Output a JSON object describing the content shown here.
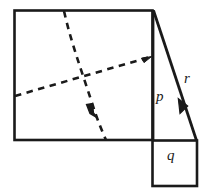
{
  "figure": {
    "background_color": "#ffffff",
    "stroke_color": "#1a1a1a",
    "labels": {
      "p": "p",
      "q": "q",
      "r": "r"
    },
    "shapes": {
      "main_square": {
        "name": "large-square",
        "x": 14,
        "y": 10,
        "width": 139,
        "height": 130,
        "style": "solid"
      },
      "small_square": {
        "name": "small-square",
        "x": 152,
        "y": 140,
        "width": 45,
        "height": 46,
        "style": "solid"
      },
      "vertical_segment_p": {
        "name": "segment-p",
        "x1": 153,
        "y1": 10,
        "x2": 153,
        "y2": 140,
        "style": "solid"
      },
      "slant_segment_r": {
        "name": "segment-r",
        "x1": 153,
        "y1": 10,
        "x2": 196,
        "y2": 140,
        "style": "solid",
        "arrow": "up-left"
      },
      "dashed_line_1": {
        "name": "dashed-diagonal-rising",
        "x1": 15,
        "y1": 96,
        "x2": 152,
        "y2": 57,
        "style": "dashed",
        "arrow": "right"
      },
      "dashed_line_2": {
        "name": "dashed-diagonal-falling",
        "x1": 64,
        "y1": 11,
        "x2": 106,
        "y2": 140,
        "style": "dashed",
        "arrow": "up"
      }
    },
    "label_positions": {
      "p": {
        "x": 156,
        "y": 101
      },
      "q": {
        "x": 167,
        "y": 160
      },
      "r": {
        "x": 184,
        "y": 83
      }
    }
  }
}
